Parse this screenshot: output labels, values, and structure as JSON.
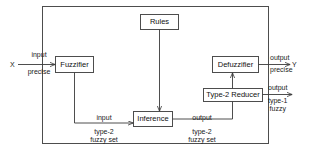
{
  "diagram": {
    "type": "block-diagram",
    "stroke_color": "#3a3a3a",
    "text_color": "#111111",
    "background": "#ffffff",
    "blocks": [
      {
        "id": "rules",
        "label": "Rules"
      },
      {
        "id": "fuzzifier",
        "label": "Fuzzifier"
      },
      {
        "id": "inference",
        "label": "Inference"
      },
      {
        "id": "type2reducer",
        "label": "Type-2 Reducer"
      },
      {
        "id": "defuzzifier",
        "label": "Defuzzifier"
      }
    ],
    "terminals": {
      "input_var": "X",
      "output_var": "Y"
    },
    "labels": {
      "input_precise": {
        "line1": "input",
        "line2": "precise"
      },
      "output_precise": {
        "line1": "output",
        "line2": "precise"
      },
      "input_type2_set": {
        "line1": "input",
        "line2": "type-2",
        "line3": "fuzzy set"
      },
      "output_type2_set": {
        "line1": "output",
        "line2": "type-2",
        "line3": "fuzzy set"
      },
      "output_type1": {
        "line1": "output",
        "line2": "type-1",
        "line3": "fuzzy"
      }
    }
  }
}
